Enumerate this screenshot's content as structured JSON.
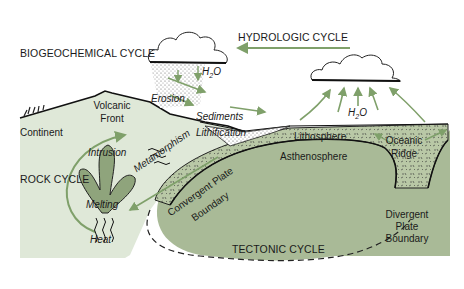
{
  "colors": {
    "background": "#ffffff",
    "continent_fill": "#dfe8d8",
    "mantle_fill": "#a9ba97",
    "lithosphere_fill": "#b9c8a6",
    "arrow_green": "#7fa06a",
    "magma_fill": "#8fa47c",
    "text": "#1a1a1a"
  },
  "cycles": {
    "biogeochemical": "BIOGEOCHEMICAL CYCLE",
    "hydrologic": "HYDROLOGIC CYCLE",
    "rock": "ROCK CYCLE",
    "tectonic": "TECTONIC CYCLE"
  },
  "labels": {
    "h2o_left": "H",
    "h2o_right": "H",
    "sub2": "2",
    "o": "O",
    "erosion": "Erosion",
    "sediments": "Sediments",
    "lithification": "Lithification",
    "continent": "Continent",
    "volcanic_front_1": "Volcanic",
    "volcanic_front_2": "Front",
    "intrusion": "Intrusion",
    "melting": "Melting",
    "heat": "Heat",
    "metamorphism": "Metamorphism",
    "convergent_1": "Convergent Plate",
    "convergent_2": "Boundary",
    "lithosphere": "Lithosphere",
    "asthenosphere": "Asthenosphere",
    "oceanic_ridge_1": "Oceanic",
    "oceanic_ridge_2": "Ridge",
    "divergent_1": "Divergent",
    "divergent_2": "Plate",
    "divergent_3": "Boundary"
  }
}
